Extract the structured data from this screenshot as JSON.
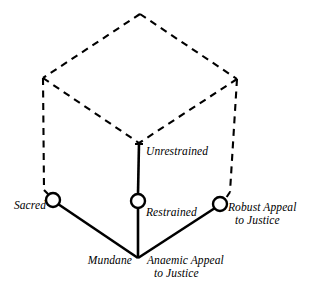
{
  "figure": {
    "type": "cube-axes-diagram",
    "background_color": "#ffffff",
    "ink_color": "#000000",
    "axes": [
      {
        "id": "sacred-mundane",
        "pole_label": "Sacred",
        "origin_label": "Mundane",
        "node_label": "Sacred"
      },
      {
        "id": "unrestrained-restrained",
        "pole_label": "Unrestrained",
        "node_label": "Restrained"
      },
      {
        "id": "appeal-to-justice",
        "pole_label": "Robust Appeal to Justice",
        "origin_label": "Anaemic Appeal to Justice"
      }
    ]
  },
  "labels": {
    "sacred": "Sacred",
    "mundane": "Mundane",
    "unrestrained": "Unrestrained",
    "restrained": "Restrained",
    "robust_appeal_line1": "Robust Appeal",
    "robust_appeal_line2": "to Justice",
    "anaemic_appeal_line1": "Anaemic Appeal",
    "anaemic_appeal_line2": "to Justice"
  },
  "nodes": [
    {
      "name": "sacred-node",
      "label": "Sacred",
      "cx": 53,
      "cy": 200,
      "r": 7
    },
    {
      "name": "restrained-node",
      "label": "Restrained",
      "cx": 138,
      "cy": 201,
      "r": 7
    },
    {
      "name": "robust-appeal-node",
      "label": "Robust Appeal to Justice",
      "cx": 220,
      "cy": 204,
      "r": 7
    }
  ],
  "geometry": {
    "cube_top_apex": [
      140,
      14
    ],
    "cube_top_left": [
      43,
      78
    ],
    "cube_top_right": [
      237,
      79
    ],
    "cube_top_center": [
      139,
      143
    ],
    "origin": [
      138,
      258
    ]
  }
}
